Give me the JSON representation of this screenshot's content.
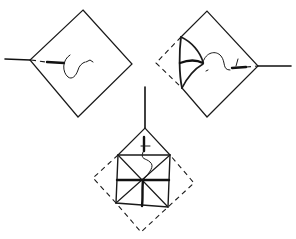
{
  "figure": {
    "type": "folding-diagram",
    "steps": [
      {
        "id": "step-1",
        "description": "Diamond-shaped square with stem on left, dashed fold line and curl arrow pointing right"
      },
      {
        "id": "step-2",
        "description": "Diamond with left corner folded in along curved creases, dashed outline showing original corner, stem on right"
      },
      {
        "id": "step-3",
        "description": "Diamond with stem on top, inner square with radial creases, dashed outline of original square"
      }
    ],
    "colors": {
      "line": "#1a1a1a",
      "background": "#ffffff"
    }
  }
}
